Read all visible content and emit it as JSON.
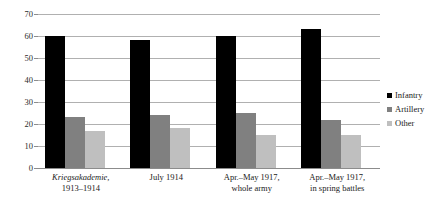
{
  "chart_data": {
    "type": "bar",
    "title": "",
    "subtitle": "",
    "xlabel": "",
    "ylabel": "",
    "ylim": [
      0,
      70
    ],
    "ytick_step": 10,
    "yticks": [
      70,
      60,
      50,
      40,
      30,
      20,
      10,
      0
    ],
    "grid": true,
    "legend_position": "right",
    "categories": [
      {
        "line1": "Kriegsakademie,",
        "line1_italic": true,
        "line2": "1913–1914"
      },
      {
        "line1": "July 1914",
        "line1_italic": false,
        "line2": ""
      },
      {
        "line1": "Apr.–May 1917,",
        "line1_italic": false,
        "line2": "whole army"
      },
      {
        "line1": "Apr.–May 1917,",
        "line1_italic": false,
        "line2": "in spring battles"
      }
    ],
    "category_labels": [
      "Kriegsakademie, 1913–1914",
      "July 1914",
      "Apr.–May 1917, whole army",
      "Apr.–May 1917, in spring battles"
    ],
    "series": [
      {
        "name": "Infantry",
        "color": "#000000",
        "values": [
          60,
          58,
          60,
          63
        ]
      },
      {
        "name": "Artillery",
        "color": "#808080",
        "values": [
          23,
          24,
          25,
          22
        ]
      },
      {
        "name": "Other",
        "color": "#bfbfbf",
        "values": [
          17,
          18,
          15,
          15
        ]
      }
    ]
  },
  "legend": {
    "items": [
      {
        "label": "Infantry",
        "swatch": "infantry"
      },
      {
        "label": "Artillery",
        "swatch": "artillery"
      },
      {
        "label": "Other",
        "swatch": "other"
      }
    ]
  },
  "colors": {
    "infantry": "#000000",
    "artillery": "#808080",
    "other": "#bfbfbf",
    "gridline": "#b0b0b0",
    "axis": "#8c8c8c",
    "text": "#1a1a1a",
    "background": "#ffffff"
  }
}
